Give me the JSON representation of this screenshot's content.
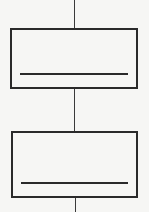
{
  "diagram": {
    "type": "vertical-flow",
    "connector_color": "#3a3a3a",
    "stroke_color": "#2a2a2a",
    "background": "#f6f6f4",
    "nodes": [
      {
        "id": "box-1",
        "label": "",
        "has_underline": true
      },
      {
        "id": "box-2",
        "label": "",
        "has_underline": true
      }
    ],
    "connectors": [
      {
        "from": "top",
        "to": "box-1"
      },
      {
        "from": "box-1",
        "to": "box-2"
      },
      {
        "from": "box-2",
        "to": "bottom"
      }
    ]
  }
}
